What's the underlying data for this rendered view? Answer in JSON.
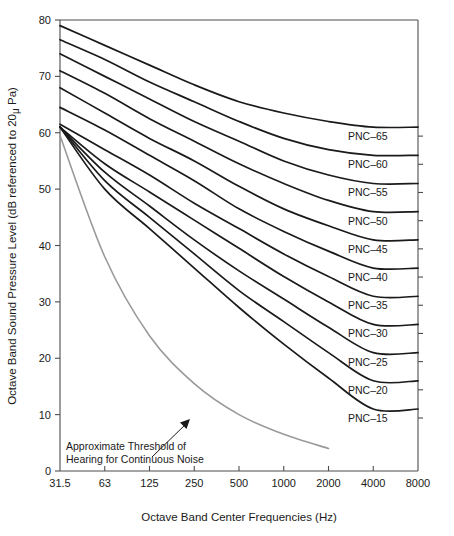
{
  "chart_data": {
    "type": "line",
    "title": "",
    "xlabel": "Octave Band Center Frequencies (Hz)",
    "ylabel": "Octave Band Sound Pressure Level (dB referenced to 20μ Pa)",
    "ylabel_parts": {
      "before": "Octave Band Sound Pressure Level (dB referenced to 20",
      "mu": "μ",
      "after": " Pa)"
    },
    "x": [
      31.5,
      63,
      125,
      250,
      500,
      1000,
      2000,
      4000,
      8000
    ],
    "xtick_labels": [
      "31.5",
      "63",
      "125",
      "250",
      "500",
      "1000",
      "2000",
      "4000",
      "8000"
    ],
    "xscale": "log2-octave",
    "ytick_labels": [
      "0",
      "10",
      "20",
      "30",
      "40",
      "50",
      "60",
      "70",
      "80"
    ],
    "yticks": [
      0,
      10,
      20,
      30,
      40,
      50,
      60,
      70,
      80
    ],
    "ylim": [
      0,
      80
    ],
    "grid": false,
    "legend_position": "inline-right-of-curves",
    "series": [
      {
        "name": "PNC-65",
        "label": "PNC–65",
        "color": "#1a1a1a",
        "values": [
          79.0,
          75.5,
          72.0,
          68.5,
          65.5,
          63.5,
          62.0,
          61.0,
          61.0
        ]
      },
      {
        "name": "PNC-60",
        "label": "PNC–60",
        "color": "#1a1a1a",
        "values": [
          76.5,
          73.0,
          69.0,
          65.5,
          62.0,
          59.0,
          57.0,
          56.0,
          56.0
        ]
      },
      {
        "name": "PNC-55",
        "label": "PNC–55",
        "color": "#1a1a1a",
        "values": [
          74.0,
          70.0,
          66.0,
          62.0,
          58.5,
          55.0,
          52.5,
          51.0,
          51.0
        ]
      },
      {
        "name": "PNC-50",
        "label": "PNC–50",
        "color": "#1a1a1a",
        "values": [
          71.0,
          67.0,
          62.5,
          58.5,
          54.5,
          51.0,
          48.0,
          46.0,
          46.0
        ]
      },
      {
        "name": "PNC-45",
        "label": "PNC–45",
        "color": "#1a1a1a",
        "values": [
          68.0,
          63.5,
          59.0,
          55.0,
          50.5,
          46.5,
          43.5,
          41.0,
          41.0
        ]
      },
      {
        "name": "PNC-40",
        "label": "PNC–40",
        "color": "#1a1a1a",
        "values": [
          64.5,
          60.5,
          56.0,
          51.5,
          46.5,
          42.5,
          39.0,
          36.0,
          36.0
        ]
      },
      {
        "name": "PNC-35",
        "label": "PNC–35",
        "color": "#1a1a1a",
        "values": [
          61.5,
          57.0,
          52.5,
          47.5,
          43.0,
          38.5,
          34.5,
          31.0,
          31.0
        ]
      },
      {
        "name": "PNC-30",
        "label": "PNC–30",
        "color": "#1a1a1a",
        "values": [
          61.0,
          54.5,
          49.5,
          44.5,
          39.5,
          34.5,
          30.0,
          26.0,
          26.0
        ]
      },
      {
        "name": "PNC-25",
        "label": "PNC–25",
        "color": "#1a1a1a",
        "values": [
          61.0,
          53.0,
          47.0,
          41.0,
          35.5,
          30.5,
          25.5,
          21.0,
          21.0
        ]
      },
      {
        "name": "PNC-20",
        "label": "PNC–20",
        "color": "#1a1a1a",
        "values": [
          61.0,
          51.5,
          45.0,
          38.5,
          32.0,
          26.5,
          21.0,
          16.0,
          16.0
        ]
      },
      {
        "name": "PNC-15",
        "label": "PNC–15",
        "color": "#1a1a1a",
        "values": [
          61.0,
          50.0,
          43.0,
          36.0,
          29.0,
          22.5,
          16.5,
          11.0,
          11.0
        ]
      }
    ],
    "threshold_curve": {
      "name": "Approximate Threshold of Hearing for Continuous Noise",
      "label_line1": "Approximate Threshold of",
      "label_line2": "Hearing for Continuous Noise",
      "color": "#9a9a9a",
      "x": [
        31.5,
        63,
        125,
        250,
        500,
        1000,
        2000
      ],
      "values": [
        59.5,
        38.0,
        24.0,
        15.5,
        10.0,
        6.5,
        4.0
      ]
    }
  },
  "colors": {
    "axis": "#4d4d4d",
    "curve": "#1a1a1a",
    "threshold": "#9a9a9a",
    "background": "#ffffff",
    "text": "#1a1a1a"
  }
}
